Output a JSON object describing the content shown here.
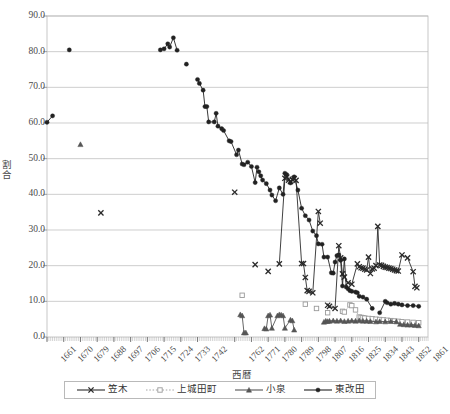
{
  "chart_data": {
    "type": "scatter",
    "title": "",
    "xlabel": "西暦",
    "ylabel": "割合",
    "xlim": [
      1661,
      1866
    ],
    "ylim": [
      0.0,
      90.0
    ],
    "yticks": [
      "0.0",
      "10.0",
      "20.0",
      "30.0",
      "40.0",
      "50.0",
      "60.0",
      "70.0",
      "80.0",
      "90.0"
    ],
    "ytick_values": [
      0,
      10,
      20,
      30,
      40,
      50,
      60,
      70,
      80,
      90
    ],
    "xticks": [
      "1661",
      "1670",
      "1679",
      "1688",
      "1697",
      "1706",
      "1715",
      "1724",
      "1733",
      "1742",
      "1762",
      "1771",
      "1780",
      "1789",
      "1798",
      "1807",
      "1816",
      "1825",
      "1834",
      "1843",
      "1852",
      "1861"
    ],
    "xtick_values": [
      1661,
      1670,
      1679,
      1688,
      1697,
      1706,
      1715,
      1724,
      1733,
      1742,
      1762,
      1771,
      1780,
      1789,
      1798,
      1807,
      1816,
      1825,
      1834,
      1843,
      1852,
      1861
    ],
    "grid": "horizontal",
    "legend_position": "bottom",
    "series": [
      {
        "name": "笠木",
        "marker": "x",
        "color": "#2b2b2b",
        "line": "solid",
        "points": [
          [
            1690,
            34.8
          ],
          [
            1762,
            40.6
          ],
          [
            1773,
            20.3
          ],
          [
            1780,
            18.4
          ],
          [
            1786,
            20.5
          ],
          [
            1789,
            44.5
          ],
          [
            1790,
            44.8
          ],
          [
            1791,
            44.0
          ],
          [
            1792,
            43.6
          ],
          [
            1793,
            44.2
          ],
          [
            1794,
            44.4
          ],
          [
            1795,
            43.9
          ],
          [
            1798,
            20.6
          ],
          [
            1799,
            20.6
          ],
          [
            1800,
            16.7
          ],
          [
            1801,
            13.0
          ],
          [
            1802,
            12.8
          ],
          [
            1804,
            12.4
          ],
          [
            1807,
            35.2
          ],
          [
            1808,
            31.9
          ],
          [
            1812,
            8.9
          ],
          [
            1813,
            8.6
          ],
          [
            1816,
            8.0
          ],
          [
            1818,
            25.6
          ],
          [
            1819,
            22.2
          ],
          [
            1820,
            17.7
          ],
          [
            1821,
            16.8
          ],
          [
            1823,
            15.2
          ],
          [
            1825,
            14.8
          ],
          [
            1828,
            20.5
          ],
          [
            1829,
            19.7
          ],
          [
            1830,
            19.4
          ],
          [
            1831,
            19.3
          ],
          [
            1832,
            19.0
          ],
          [
            1833,
            18.8
          ],
          [
            1834,
            22.4
          ],
          [
            1835,
            17.8
          ],
          [
            1836,
            19.1
          ],
          [
            1837,
            19.3
          ],
          [
            1838,
            20.0
          ],
          [
            1839,
            31.0
          ],
          [
            1840,
            20.2
          ],
          [
            1841,
            20.1
          ],
          [
            1842,
            19.8
          ],
          [
            1843,
            19.6
          ],
          [
            1844,
            19.5
          ],
          [
            1845,
            19.3
          ],
          [
            1846,
            19.2
          ],
          [
            1847,
            19.0
          ],
          [
            1848,
            18.8
          ],
          [
            1849,
            18.6
          ],
          [
            1850,
            18.5
          ],
          [
            1852,
            23.0
          ],
          [
            1855,
            22.2
          ],
          [
            1858,
            18.3
          ],
          [
            1859,
            14.2
          ],
          [
            1860,
            13.8
          ]
        ]
      },
      {
        "name": "上城田町",
        "marker": "square",
        "color": "#9a9a9a",
        "line": "dotted",
        "points": [
          [
            1766,
            11.7
          ],
          [
            1800,
            9.2
          ],
          [
            1806,
            8.0
          ],
          [
            1812,
            6.8
          ],
          [
            1820,
            7.2
          ],
          [
            1821,
            7.0
          ],
          [
            1824,
            9.0
          ],
          [
            1825,
            8.8
          ],
          [
            1827,
            7.6
          ],
          [
            1829,
            5.6
          ],
          [
            1830,
            5.5
          ],
          [
            1831,
            5.4
          ],
          [
            1832,
            5.3
          ],
          [
            1834,
            5.2
          ],
          [
            1836,
            5.1
          ],
          [
            1838,
            5.0
          ],
          [
            1840,
            4.9
          ],
          [
            1842,
            4.8
          ],
          [
            1844,
            4.7
          ],
          [
            1846,
            4.6
          ],
          [
            1848,
            4.5
          ],
          [
            1850,
            4.4
          ],
          [
            1852,
            4.3
          ],
          [
            1855,
            4.2
          ],
          [
            1858,
            4.1
          ],
          [
            1861,
            4.0
          ]
        ]
      },
      {
        "name": "小泉",
        "marker": "triangle",
        "color": "#555555",
        "line": "solid",
        "points": [
          [
            1679,
            54.0
          ],
          [
            1765,
            6.3
          ],
          [
            1766,
            6.0
          ],
          [
            1767,
            1.2
          ],
          [
            1768,
            1.2
          ],
          [
            1778,
            2.4
          ],
          [
            1779,
            2.3
          ],
          [
            1780,
            6.0
          ],
          [
            1781,
            6.2
          ],
          [
            1782,
            2.5
          ],
          [
            1785,
            6.0
          ],
          [
            1786,
            6.3
          ],
          [
            1787,
            6.2
          ],
          [
            1788,
            6.0
          ],
          [
            1789,
            2.5
          ],
          [
            1792,
            4.8
          ],
          [
            1793,
            4.6
          ],
          [
            1794,
            2.0
          ],
          [
            1810,
            4.2
          ],
          [
            1811,
            4.5
          ],
          [
            1812,
            4.4
          ],
          [
            1813,
            4.5
          ],
          [
            1815,
            4.6
          ],
          [
            1817,
            4.5
          ],
          [
            1819,
            4.6
          ],
          [
            1821,
            4.4
          ],
          [
            1823,
            4.5
          ],
          [
            1825,
            4.6
          ],
          [
            1827,
            4.5
          ],
          [
            1829,
            4.6
          ],
          [
            1831,
            4.5
          ],
          [
            1833,
            4.5
          ],
          [
            1835,
            4.4
          ],
          [
            1838,
            4.3
          ],
          [
            1840,
            4.4
          ],
          [
            1843,
            4.3
          ],
          [
            1846,
            4.4
          ],
          [
            1849,
            4.3
          ],
          [
            1851,
            3.6
          ],
          [
            1853,
            3.5
          ],
          [
            1855,
            3.4
          ],
          [
            1857,
            3.4
          ],
          [
            1859,
            3.3
          ],
          [
            1861,
            3.2
          ]
        ]
      },
      {
        "name": "東改田",
        "marker": "circle",
        "color": "#222222",
        "line": "solid",
        "points": [
          [
            1661,
            60.2
          ],
          [
            1664,
            62.0
          ],
          [
            1673,
            80.5
          ],
          [
            1722,
            80.5
          ],
          [
            1724,
            80.8
          ],
          [
            1726,
            82.2
          ],
          [
            1727,
            81.3
          ],
          [
            1729,
            83.9
          ],
          [
            1731,
            80.4
          ],
          [
            1736,
            76.5
          ],
          [
            1742,
            72.2
          ],
          [
            1743,
            71.1
          ],
          [
            1745,
            69.2
          ],
          [
            1746,
            64.6
          ],
          [
            1747,
            64.6
          ],
          [
            1748,
            60.3
          ],
          [
            1751,
            60.3
          ],
          [
            1752,
            62.7
          ],
          [
            1753,
            59.1
          ],
          [
            1755,
            58.4
          ],
          [
            1756,
            57.9
          ],
          [
            1759,
            55.0
          ],
          [
            1760,
            54.8
          ],
          [
            1763,
            51.1
          ],
          [
            1764,
            52.4
          ],
          [
            1766,
            48.5
          ],
          [
            1767,
            48.3
          ],
          [
            1769,
            49.0
          ],
          [
            1771,
            47.8
          ],
          [
            1773,
            43.3
          ],
          [
            1774,
            47.6
          ],
          [
            1775,
            46.3
          ],
          [
            1776,
            45.2
          ],
          [
            1777,
            44.0
          ],
          [
            1779,
            43.0
          ],
          [
            1781,
            41.2
          ],
          [
            1782,
            39.8
          ],
          [
            1784,
            38.2
          ],
          [
            1786,
            41.8
          ],
          [
            1788,
            40.0
          ],
          [
            1789,
            45.9
          ],
          [
            1790,
            45.5
          ],
          [
            1792,
            43.2
          ],
          [
            1794,
            44.9
          ],
          [
            1796,
            41.2
          ],
          [
            1798,
            36.1
          ],
          [
            1800,
            34.0
          ],
          [
            1802,
            32.8
          ],
          [
            1804,
            29.7
          ],
          [
            1806,
            28.4
          ],
          [
            1807,
            26.1
          ],
          [
            1809,
            26.0
          ],
          [
            1810,
            22.4
          ],
          [
            1812,
            22.4
          ],
          [
            1814,
            18.0
          ],
          [
            1815,
            17.9
          ],
          [
            1816,
            21.0
          ],
          [
            1817,
            22.8
          ],
          [
            1818,
            23.0
          ],
          [
            1819,
            21.5
          ],
          [
            1820,
            14.3
          ],
          [
            1821,
            21.9
          ],
          [
            1822,
            14.0
          ],
          [
            1823,
            13.5
          ],
          [
            1824,
            13.0
          ],
          [
            1825,
            12.8
          ],
          [
            1827,
            12.6
          ],
          [
            1828,
            12.4
          ],
          [
            1829,
            11.4
          ],
          [
            1831,
            11.2
          ],
          [
            1833,
            10.6
          ],
          [
            1836,
            8.0
          ],
          [
            1840,
            6.8
          ],
          [
            1843,
            10.0
          ],
          [
            1844,
            9.6
          ],
          [
            1846,
            9.2
          ],
          [
            1848,
            9.4
          ],
          [
            1850,
            9.2
          ],
          [
            1852,
            9.0
          ],
          [
            1855,
            8.8
          ],
          [
            1858,
            8.8
          ],
          [
            1861,
            8.6
          ]
        ]
      }
    ]
  },
  "legend": {
    "items": [
      {
        "label": "笠木",
        "marker": "x",
        "line": "solid",
        "color": "#2b2b2b"
      },
      {
        "label": "上城田町",
        "marker": "square",
        "line": "dotted",
        "color": "#9a9a9a"
      },
      {
        "label": "小泉",
        "marker": "triangle",
        "line": "solid",
        "color": "#555555"
      },
      {
        "label": "東改田",
        "marker": "circle",
        "line": "solid",
        "color": "#222222"
      }
    ]
  },
  "footer": {
    "note": ""
  }
}
